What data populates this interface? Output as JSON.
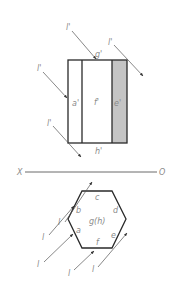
{
  "diagram": {
    "type": "orthographic-projection-shading",
    "colors": {
      "edge": "#2a2a2a",
      "ray": "#555555",
      "label": "#8a8a8a",
      "shade": "#c4c4c4",
      "background": "#ffffff"
    },
    "ground_line": {
      "left_label": "X",
      "right_label": "O"
    },
    "elevation": {
      "faces": [
        {
          "label": "a'",
          "shaded": false
        },
        {
          "label": "f'",
          "shaded": false
        },
        {
          "label": "e'",
          "shaded": true
        }
      ],
      "top_label": "g'",
      "bottom_label": "h'",
      "rays": [
        {
          "label": "l'",
          "position": "top-center"
        },
        {
          "label": "l'",
          "position": "top-right"
        },
        {
          "label": "l'",
          "position": "left-middle"
        },
        {
          "label": "l'",
          "position": "left-bottom"
        }
      ]
    },
    "plan": {
      "vertices": [
        "a",
        "b",
        "c",
        "d",
        "e",
        "f"
      ],
      "center_label": "g(h)",
      "rays": [
        {
          "label": "l",
          "position": "upper-left-1"
        },
        {
          "label": "l",
          "position": "upper-left-2"
        },
        {
          "label": "l",
          "position": "lower-left"
        },
        {
          "label": "l",
          "position": "bottom-1"
        },
        {
          "label": "l",
          "position": "bottom-2"
        }
      ]
    }
  }
}
